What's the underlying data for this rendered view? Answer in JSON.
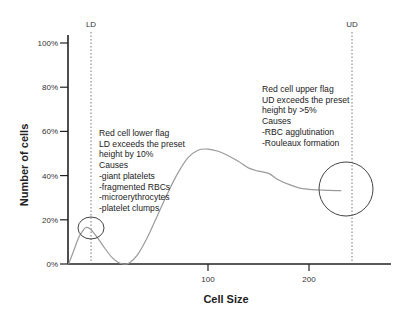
{
  "chart_data": {
    "type": "line",
    "title": "",
    "xlabel": "Cell Size",
    "ylabel": "Number of cells",
    "xlim": [
      -45,
      235
    ],
    "ylim": [
      0,
      100
    ],
    "x_ticks": [
      100,
      200
    ],
    "x_tick_labels": [
      "100",
      "200"
    ],
    "y_ticks": [
      0,
      20,
      40,
      60,
      80,
      100
    ],
    "y_tick_labels": [
      "0%",
      "20%",
      "40%",
      "60%",
      "80%",
      "100%"
    ],
    "grid": false,
    "series": [
      {
        "name": "RBC histogram",
        "color": "#9a9a9a",
        "x": [
          -38,
          -33,
          -28,
          -24,
          -21,
          -17,
          -13,
          -8,
          -2,
          4,
          10,
          16,
          22,
          30,
          40,
          50,
          60,
          70,
          80,
          90,
          100,
          110,
          120,
          130,
          140,
          150,
          160,
          170,
          180,
          190,
          200,
          210,
          220,
          232
        ],
        "y": [
          0,
          6,
          12,
          15,
          16.5,
          16,
          14,
          11,
          7,
          3.5,
          1,
          0,
          0.5,
          4,
          12,
          22,
          32,
          41,
          48,
          51.5,
          52,
          51,
          49,
          46.5,
          43.5,
          42,
          41,
          38,
          36,
          34.5,
          33.8,
          33.5,
          33.3,
          33.2
        ]
      }
    ],
    "flags": [
      {
        "name": "LD",
        "x": -22,
        "style": "dotted"
      },
      {
        "name": "UD",
        "x": 235,
        "style": "dotted"
      }
    ],
    "highlight_circles": [
      {
        "label": "lower-flag-region",
        "cx": -22,
        "cy": 16
      },
      {
        "label": "upper-flag-region",
        "cx": 220,
        "cy": 33
      }
    ],
    "annotations": [
      {
        "id": "lower",
        "lines": [
          "Red cell lower flag",
          "LD exceeds the preset",
          "height by 10%",
          "Causes",
          "-giant platelets",
          "-fragmented RBCs",
          "-microerythrocytes",
          "-platelet clumps"
        ]
      },
      {
        "id": "upper",
        "lines": [
          "Red cell upper flag",
          "UD exceeds the preset",
          "height by >5%",
          "Causes",
          "-RBC agglutination",
          "-Rouleaux formation"
        ]
      }
    ]
  }
}
